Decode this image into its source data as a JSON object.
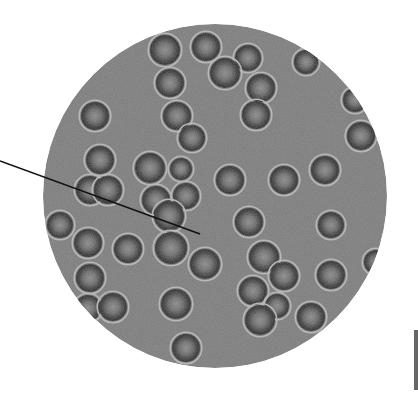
{
  "image": {
    "subject": "Red blood cells under light microscope",
    "background": "#ffffff",
    "field": {
      "cx": 215,
      "cy": 196,
      "r": 172,
      "fill": "#7a7a7a"
    },
    "pointer": {
      "x1": 0,
      "y1": 161,
      "x2": 200,
      "y2": 234,
      "color": "#111111"
    },
    "cells": [
      [
        165,
        50,
        15
      ],
      [
        206,
        47,
        14
      ],
      [
        248,
        58,
        13
      ],
      [
        225,
        73,
        15
      ],
      [
        170,
        83,
        14
      ],
      [
        261,
        88,
        14
      ],
      [
        306,
        62,
        12
      ],
      [
        95,
        116,
        14
      ],
      [
        177,
        116,
        14
      ],
      [
        192,
        138,
        13
      ],
      [
        256,
        115,
        14
      ],
      [
        355,
        100,
        12
      ],
      [
        361,
        136,
        14
      ],
      [
        100,
        160,
        14
      ],
      [
        150,
        168,
        15
      ],
      [
        181,
        169,
        11
      ],
      [
        90,
        190,
        14
      ],
      [
        108,
        190,
        14
      ],
      [
        156,
        200,
        14
      ],
      [
        186,
        196,
        13
      ],
      [
        230,
        180,
        14
      ],
      [
        284,
        180,
        14
      ],
      [
        325,
        170,
        14
      ],
      [
        169,
        216,
        15
      ],
      [
        60,
        225,
        13
      ],
      [
        249,
        222,
        14
      ],
      [
        331,
        225,
        13
      ],
      [
        88,
        243,
        14
      ],
      [
        128,
        249,
        14
      ],
      [
        171,
        248,
        16
      ],
      [
        205,
        264,
        15
      ],
      [
        90,
        278,
        14
      ],
      [
        264,
        257,
        15
      ],
      [
        284,
        276,
        14
      ],
      [
        331,
        275,
        14
      ],
      [
        376,
        262,
        12
      ],
      [
        88,
        308,
        13
      ],
      [
        113,
        307,
        14
      ],
      [
        253,
        291,
        14
      ],
      [
        277,
        306,
        12
      ],
      [
        311,
        317,
        14
      ],
      [
        176,
        304,
        15
      ],
      [
        260,
        320,
        15
      ],
      [
        186,
        348,
        14
      ]
    ],
    "side_object": {
      "x": 414,
      "y": 330,
      "w": 4,
      "h": 60,
      "color": "#666666"
    }
  }
}
